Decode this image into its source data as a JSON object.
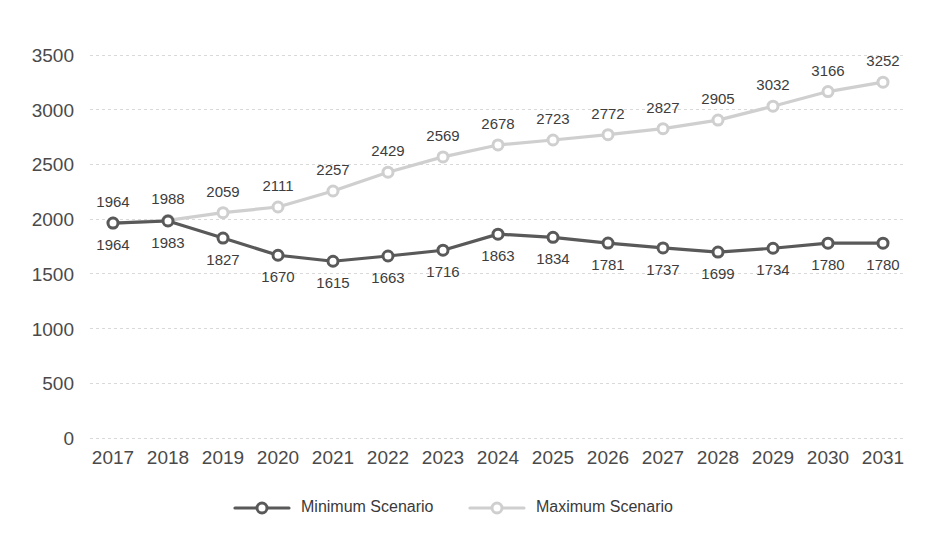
{
  "chart_data": {
    "type": "line",
    "title": "",
    "subtitle": "",
    "xlabel": "",
    "ylabel": "",
    "categories": [
      "2017",
      "2018",
      "2019",
      "2020",
      "2021",
      "2022",
      "2023",
      "2024",
      "2025",
      "2026",
      "2027",
      "2028",
      "2029",
      "2030",
      "2031"
    ],
    "series": [
      {
        "name": "Minimum Scenario",
        "color": "#595959",
        "label_position": "below",
        "values": [
          1964,
          1983,
          1827,
          1670,
          1615,
          1663,
          1716,
          1863,
          1834,
          1781,
          1737,
          1699,
          1734,
          1780,
          1780
        ]
      },
      {
        "name": "Maximum Scenario",
        "color": "#cfcfcf",
        "label_position": "above",
        "values": [
          1964,
          1988,
          2059,
          2111,
          2257,
          2429,
          2569,
          2678,
          2723,
          2772,
          2827,
          2905,
          3032,
          3166,
          3252
        ]
      }
    ],
    "yticks": [
      0,
      500,
      1000,
      1500,
      2000,
      2500,
      3000,
      3500
    ],
    "ylim": [
      0,
      3500
    ],
    "grid": true,
    "grid_axis": "y",
    "grid_color": "#d9d9d9",
    "legend": true,
    "legend_position": "bottom",
    "marker": "circle-open",
    "background": "#ffffff"
  },
  "legend": {
    "items": [
      {
        "label": "Minimum Scenario",
        "color": "#595959"
      },
      {
        "label": "Maximum Scenario",
        "color": "#cfcfcf"
      }
    ]
  }
}
